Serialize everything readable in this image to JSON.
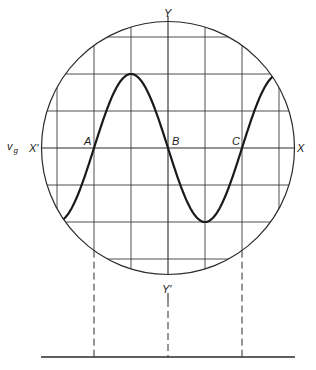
{
  "diagram": {
    "type": "oscilloscope-screen",
    "screen": {
      "center_x": 168,
      "center_y": 148,
      "radius": 126.5,
      "grid_spacing": 37,
      "divisions_each_side": 3
    },
    "axes": {
      "horizontal": {
        "left_label": "X'",
        "right_label": "X"
      },
      "vertical": {
        "top_label": "Y",
        "bottom_label": "Y'"
      }
    },
    "signal_label": {
      "main": "v",
      "subscript": "g"
    },
    "waveform": {
      "shape": "sine",
      "amplitude_divisions": 2,
      "period_divisions": 4,
      "stroke_color": "#1a1a1a"
    },
    "points": [
      {
        "label": "A",
        "x": 94,
        "y": 148,
        "description": "zero crossing (rising)"
      },
      {
        "label": "B",
        "x": 168,
        "y": 148,
        "description": "zero crossing (falling)"
      },
      {
        "label": "C",
        "x": 242,
        "y": 148,
        "description": "zero crossing (rising)"
      }
    ],
    "projection_lines": {
      "style": "dashed",
      "to_baseline": true
    },
    "baseline": {
      "y": 357,
      "x_start": 41,
      "x_end": 295
    }
  }
}
